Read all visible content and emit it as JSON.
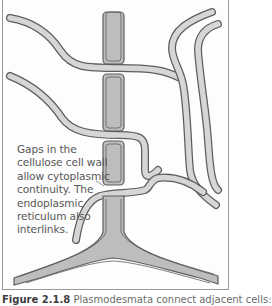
{
  "figure": {
    "annotation_lines": [
      "Gaps in the",
      "cellulose cell wall",
      "allow cytoplasmic",
      "continuity.  The",
      "endoplasmic",
      "reticulum also",
      "interlinks."
    ],
    "caption_label": "Figure 2.1.8",
    "caption_text": "Plasmodesmata connect adjacent cells:",
    "colors": {
      "wall_fill": "#bdbdbd",
      "er_fill": "#d6d6d6",
      "outline": "#5e5e5e",
      "frame": "#9a9a9a",
      "text": "#575757"
    }
  }
}
